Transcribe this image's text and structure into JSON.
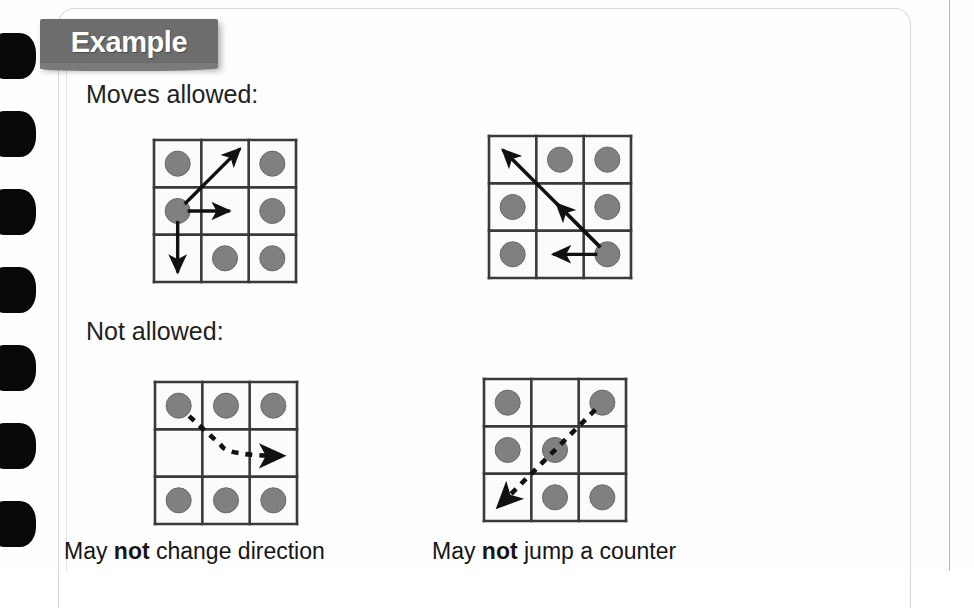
{
  "page": {
    "banner_label": "Example",
    "heading_moves": "Moves allowed:",
    "heading_not": "Not allowed:",
    "binding_holes": 7,
    "colors": {
      "banner_background": "#6d6d6d",
      "banner_text": "#ffffff",
      "counter_fill": "#808080",
      "counter_stroke": "#6a6a6a",
      "grid_line": "#3a3a3a",
      "arrow": "#111111",
      "paper": "#fefefe",
      "binding_hole": "#080808"
    }
  },
  "captions": {
    "left": {
      "prefix": "May ",
      "bold": "not",
      "suffix": " change direction"
    },
    "right": {
      "prefix": "May ",
      "bold": "not",
      "suffix": " jump a counter"
    }
  },
  "grids": [
    {
      "id": "grid-moves-1",
      "name": "moves-allowed-grid-1",
      "section": "Moves allowed",
      "style": "solid",
      "counters": [
        [
          true,
          false,
          true
        ],
        [
          true,
          false,
          true
        ],
        [
          false,
          true,
          true
        ]
      ],
      "active_cell": {
        "row": 1,
        "col": 0
      },
      "arrows": [
        {
          "name": "diagonal-up-right-arrow",
          "from": [
            1,
            0
          ],
          "to": [
            0,
            1
          ],
          "extend": 0.45,
          "style": "solid"
        },
        {
          "name": "right-arrow",
          "from": [
            1,
            0
          ],
          "to": [
            1,
            1
          ],
          "extend": 0.1,
          "style": "solid"
        },
        {
          "name": "down-arrow",
          "from": [
            1,
            0
          ],
          "to": [
            2,
            0
          ],
          "extend": 0.3,
          "style": "solid"
        }
      ]
    },
    {
      "id": "grid-moves-2",
      "name": "moves-allowed-grid-2",
      "section": "Moves allowed",
      "style": "solid",
      "counters": [
        [
          false,
          true,
          true
        ],
        [
          true,
          false,
          true
        ],
        [
          true,
          false,
          true
        ]
      ],
      "active_cell": {
        "row": 2,
        "col": 2
      },
      "arrows": [
        {
          "name": "long-diagonal-up-left-arrow",
          "from": [
            2,
            2
          ],
          "to": [
            0,
            0
          ],
          "extend": 0.3,
          "style": "solid"
        },
        {
          "name": "short-diagonal-up-left-arrow",
          "from": [
            2,
            2
          ],
          "to": [
            1,
            1
          ],
          "extend": 0.1,
          "style": "solid"
        },
        {
          "name": "left-arrow",
          "from": [
            2,
            2
          ],
          "to": [
            2,
            1
          ],
          "extend": 0.15,
          "style": "solid"
        }
      ]
    },
    {
      "id": "grid-not-1",
      "name": "not-allowed-grid-change-direction",
      "section": "Not allowed",
      "style": "dashed",
      "counters": [
        [
          true,
          true,
          true
        ],
        [
          false,
          false,
          false
        ],
        [
          true,
          true,
          true
        ]
      ],
      "active_cell": {
        "row": 0,
        "col": 0
      },
      "arrows": [
        {
          "name": "dashed-curved-change-direction-arrow",
          "type": "curve",
          "style": "dashed",
          "path": "diagonal-down-right-then-right"
        }
      ]
    },
    {
      "id": "grid-not-2",
      "name": "not-allowed-grid-jump-counter",
      "section": "Not allowed",
      "style": "dashed",
      "counters": [
        [
          true,
          false,
          true
        ],
        [
          true,
          true,
          false
        ],
        [
          false,
          true,
          true
        ]
      ],
      "active_cell": {
        "row": 0,
        "col": 2
      },
      "arrows": [
        {
          "name": "dashed-diagonal-down-left-jump-arrow",
          "from": [
            0,
            2
          ],
          "to": [
            2,
            0
          ],
          "extend": 0.3,
          "style": "dashed"
        }
      ]
    }
  ],
  "layout": {
    "grid_positions": [
      {
        "id": "grid-moves-1",
        "left": 154,
        "top": 140,
        "size": 142
      },
      {
        "id": "grid-moves-2",
        "left": 489,
        "top": 136,
        "size": 142
      },
      {
        "id": "grid-not-1",
        "left": 155,
        "top": 382,
        "size": 142
      },
      {
        "id": "grid-not-2",
        "left": 484,
        "top": 379,
        "size": 142
      }
    ]
  }
}
